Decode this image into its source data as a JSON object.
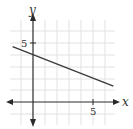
{
  "chart_data": {
    "type": "line",
    "title": "",
    "xlabel": "x",
    "ylabel": "y",
    "x_tick_labels": [
      "5"
    ],
    "y_tick_labels": [
      "5"
    ],
    "xlim": [
      -2.5,
      7
    ],
    "ylim": [
      -3,
      8
    ],
    "grid": true,
    "legend": null,
    "series": [
      {
        "name": "line",
        "x": [
          -1.7,
          6.7
        ],
        "y": [
          4.7,
          1.35
        ],
        "equation": "y = -0.4x + 4"
      }
    ]
  },
  "labels": {
    "x_axis": "x",
    "y_axis": "y",
    "x_tick": "5",
    "y_tick": "5"
  },
  "colors": {
    "axis": "#2a2a2a",
    "line": "#3a3a3a",
    "grid": "#e2e2e2"
  }
}
